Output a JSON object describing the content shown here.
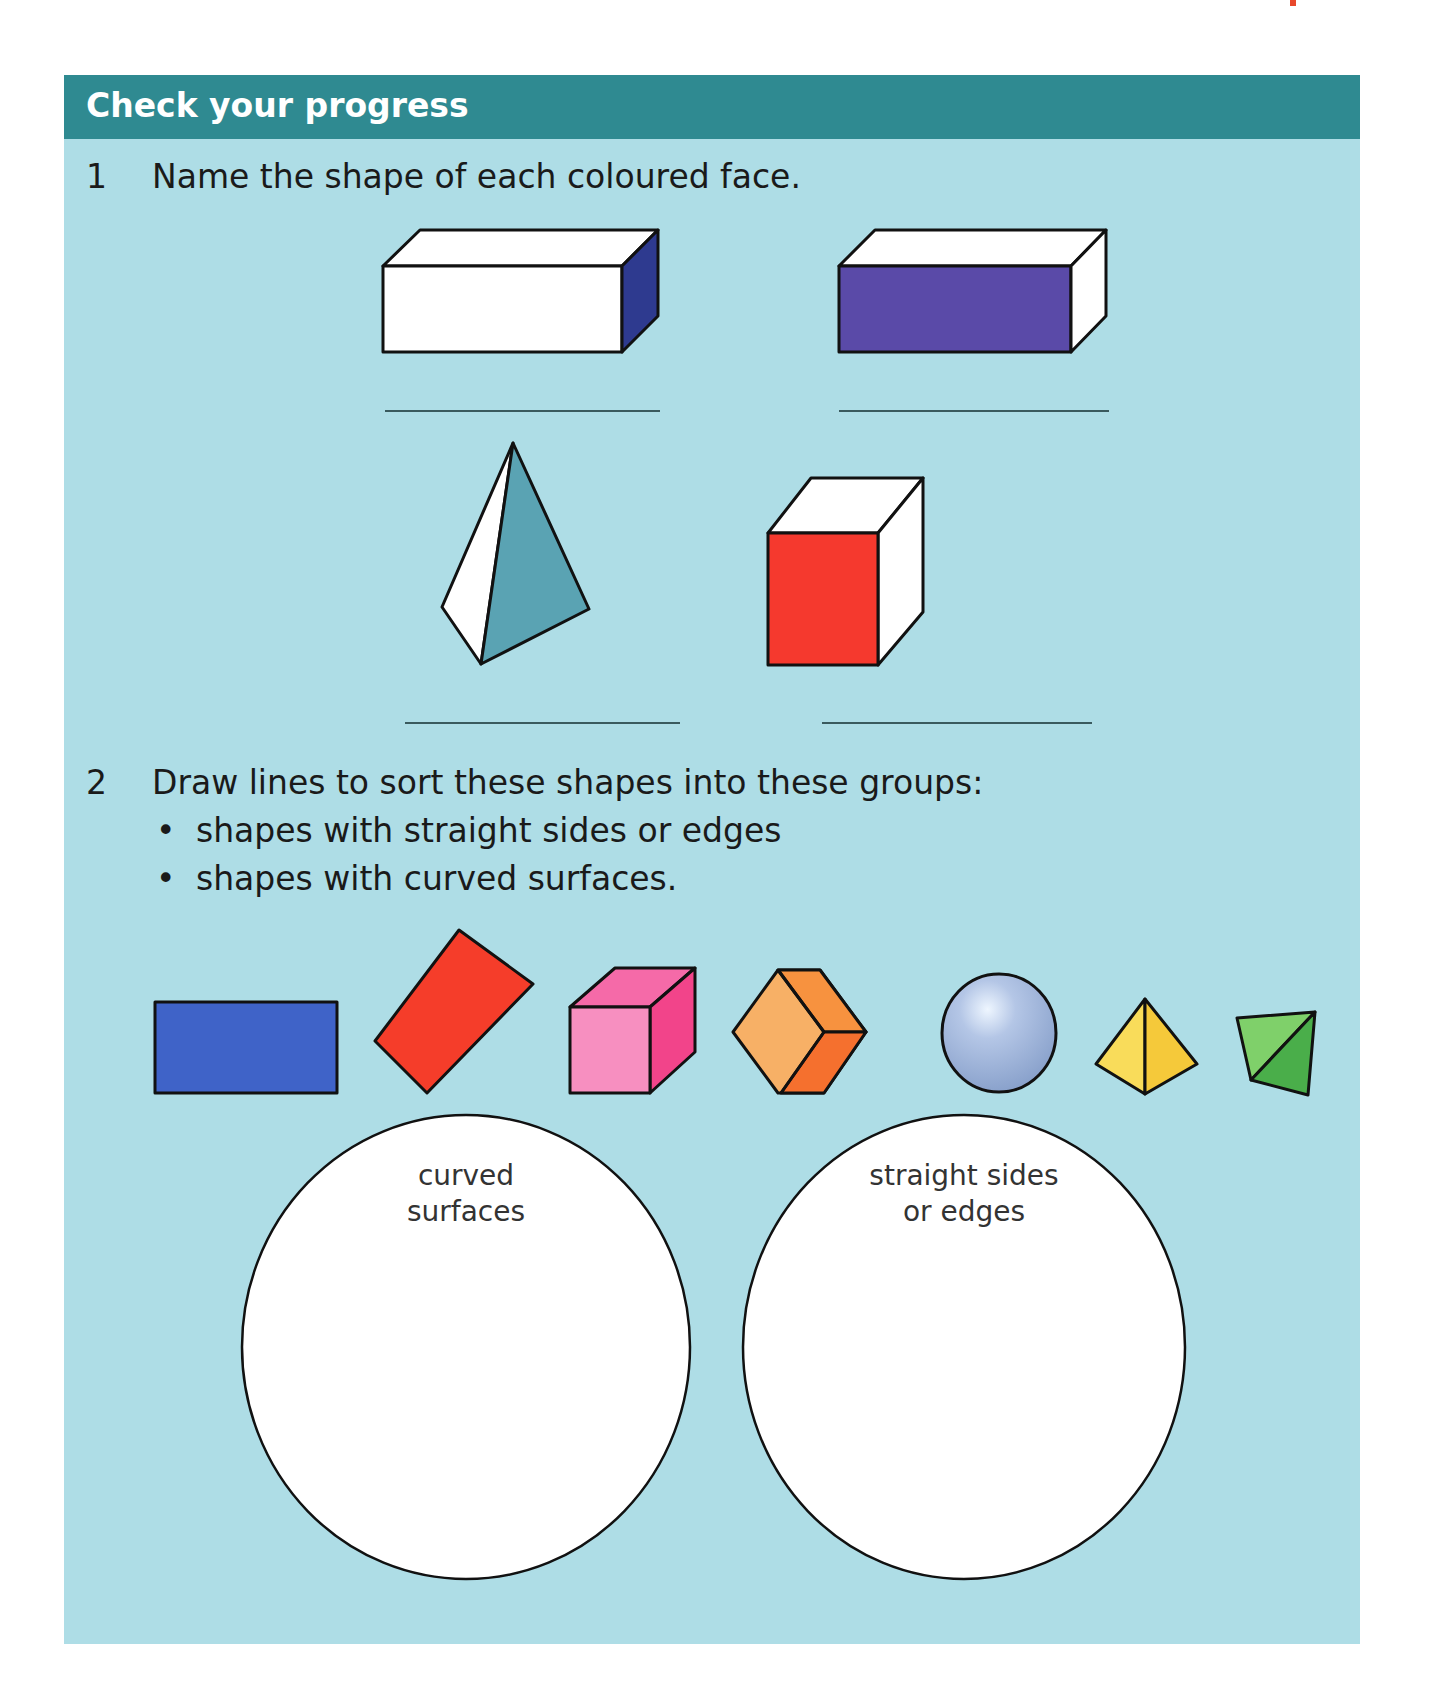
{
  "header": {
    "title": "Check your progress"
  },
  "question1": {
    "number": "1",
    "prompt": "Name the shape of each coloured face.",
    "shapes": [
      {
        "name": "cuboid-side-face",
        "coloured_face_color": "#2e3a8f"
      },
      {
        "name": "cuboid-front-face",
        "coloured_face_color": "#5a4aa8"
      },
      {
        "name": "tetrahedron-face",
        "coloured_face_color": "#5aa3b3"
      },
      {
        "name": "cube-front-face",
        "coloured_face_color": "#f5392e"
      }
    ]
  },
  "question2": {
    "number": "2",
    "prompt": "Draw lines to sort these shapes into these groups:",
    "bullets": [
      "shapes with straight sides or edges",
      "shapes with curved surfaces."
    ],
    "shapes": [
      {
        "name": "blue-rectangle",
        "color": "#3f63c8"
      },
      {
        "name": "red-rotated-rectangle",
        "color": "#f53d2a"
      },
      {
        "name": "pink-cube",
        "color": "#f57ab0"
      },
      {
        "name": "orange-cube",
        "color": "#f7a55a"
      },
      {
        "name": "blue-sphere",
        "color": "#9fb5d8"
      },
      {
        "name": "yellow-pyramid",
        "color": "#f9d84a"
      },
      {
        "name": "green-tetrahedron",
        "color": "#5fbd5a"
      }
    ],
    "groups": [
      {
        "label_line1": "curved",
        "label_line2": "surfaces"
      },
      {
        "label_line1": "straight sides",
        "label_line2": "or edges"
      }
    ]
  },
  "colors": {
    "header_bg": "#2f8a91",
    "panel_bg": "#aedde6"
  }
}
